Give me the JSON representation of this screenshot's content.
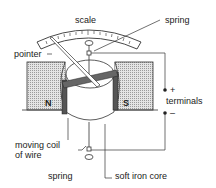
{
  "diagram": {
    "labels": {
      "scale": "scale",
      "spring_top": "spring",
      "pointer": "pointer",
      "north": "N",
      "south": "S",
      "plus": "+",
      "minus": "–",
      "terminals": "terminals",
      "coil_line1": "moving coil",
      "coil_line2": "of wire",
      "spring_bottom": "spring",
      "core": "soft iron core"
    },
    "colors": {
      "magnet_fill": "#cfcfcf",
      "line": "#333333",
      "coil": "#555555"
    }
  }
}
